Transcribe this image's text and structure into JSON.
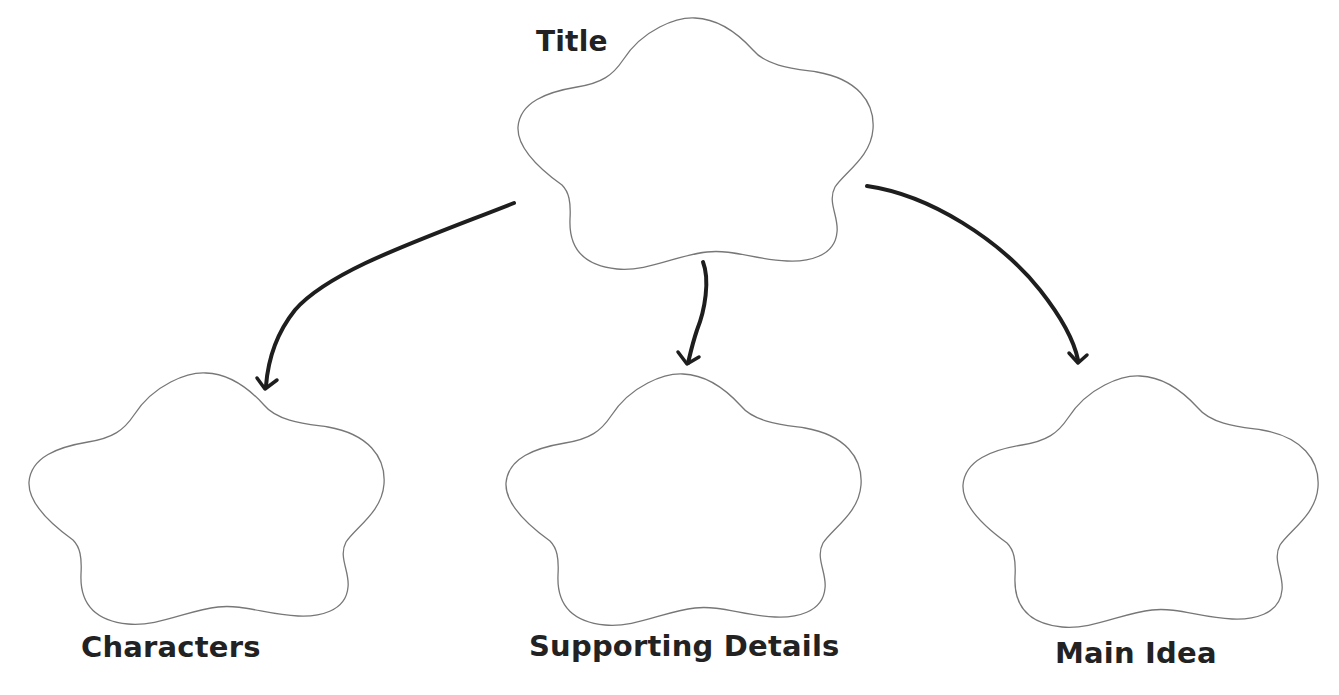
{
  "diagram": {
    "type": "graphic organizer / concept map",
    "colors": {
      "background": "#ffffff",
      "shape_outline": "#777777",
      "arrow": "#1e1e1e",
      "label_text": "#222222"
    },
    "nodes": [
      {
        "id": "title",
        "label": "Title",
        "shape": "flower-cloud",
        "position": "top-center"
      },
      {
        "id": "characters",
        "label": "Characters",
        "shape": "flower-cloud",
        "position": "bottom-left"
      },
      {
        "id": "supporting_details",
        "label": "Supporting Details",
        "shape": "flower-cloud",
        "position": "bottom-center"
      },
      {
        "id": "main_idea",
        "label": "Main Idea",
        "shape": "flower-cloud",
        "position": "bottom-right"
      }
    ],
    "edges": [
      {
        "from": "title",
        "to": "characters"
      },
      {
        "from": "title",
        "to": "supporting_details"
      },
      {
        "from": "title",
        "to": "main_idea"
      }
    ]
  }
}
